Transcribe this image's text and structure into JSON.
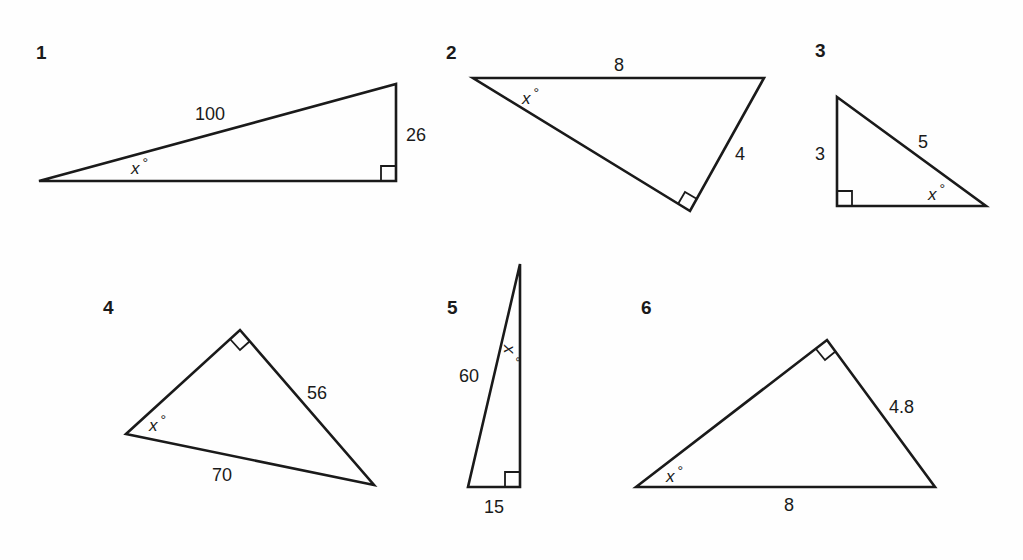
{
  "figure": {
    "problems": [
      {
        "number": "1",
        "sides": {
          "hypotenuse": "100",
          "opposite": "26"
        },
        "angle_label": "x",
        "degree_symbol": "°"
      },
      {
        "number": "2",
        "sides": {
          "hypotenuse": "8",
          "opposite": "4"
        },
        "angle_label": "x",
        "degree_symbol": "°"
      },
      {
        "number": "3",
        "sides": {
          "opposite": "3",
          "hypotenuse": "5"
        },
        "angle_label": "x",
        "degree_symbol": "°"
      },
      {
        "number": "4",
        "sides": {
          "opposite": "56",
          "hypotenuse": "70"
        },
        "angle_label": "x",
        "degree_symbol": "°"
      },
      {
        "number": "5",
        "sides": {
          "hypotenuse": "60",
          "opposite": "15"
        },
        "angle_label": "x",
        "degree_symbol": "°"
      },
      {
        "number": "6",
        "sides": {
          "opposite": "4.8",
          "hypotenuse": "8"
        },
        "angle_label": "x",
        "degree_symbol": "°"
      }
    ]
  }
}
